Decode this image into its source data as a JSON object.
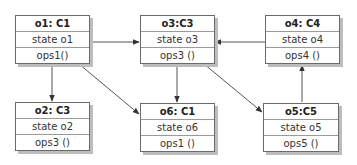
{
  "diagram": {
    "type": "uml-object-diagram",
    "line_color": "#555555",
    "objects": [
      {
        "id": "o1",
        "title": "o1: C1",
        "state": "state o1",
        "ops": "ops1()"
      },
      {
        "id": "o3",
        "title": "o3:C3",
        "state": "state o3",
        "ops": "ops3 ()"
      },
      {
        "id": "o4",
        "title": "o4: C4",
        "state": "state o4",
        "ops": "ops4 ()"
      },
      {
        "id": "o2",
        "title": "o2: C3",
        "state": "state o2",
        "ops": "ops3 ()"
      },
      {
        "id": "o6",
        "title": "o6: C1",
        "state": "state o6",
        "ops": "ops1 ()"
      },
      {
        "id": "o5",
        "title": "o5:C5",
        "state": "state o5",
        "ops": "ops5 ()"
      }
    ],
    "links": [
      {
        "from": "o1",
        "to": "o3"
      },
      {
        "from": "o1",
        "to": "o2"
      },
      {
        "from": "o1",
        "to": "o6"
      },
      {
        "from": "o4",
        "to": "o3"
      },
      {
        "from": "o3",
        "to": "o6"
      },
      {
        "from": "o3",
        "to": "o5"
      },
      {
        "from": "o5",
        "to": "o4"
      }
    ]
  }
}
